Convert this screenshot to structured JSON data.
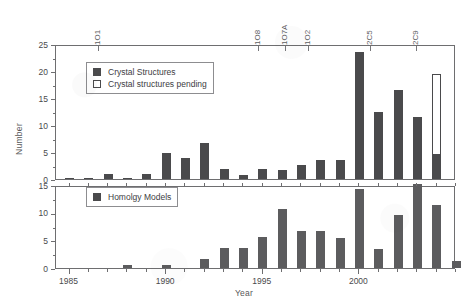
{
  "chart_data": {
    "type": "bar",
    "title": "",
    "xlabel": "Year",
    "ylabel": "Number",
    "grid": false,
    "panels": [
      {
        "name": "upper",
        "ylim": [
          0,
          25
        ],
        "yticks": [
          0,
          5,
          10,
          15,
          20,
          25
        ],
        "inverted": false,
        "legend_position": "top-left",
        "series": [
          {
            "name": "Crystal Structures",
            "color": "#4a4a4c",
            "style": "filled",
            "values": [
              0.2,
              0.2,
              0.9,
              0.2,
              0.9,
              4.8,
              3.8,
              6.7,
              1.8,
              0.8,
              1.8,
              1.7,
              2.6,
              3.5,
              3.5,
              23.6,
              12.5,
              16.5,
              11.5,
              4.4
            ]
          },
          {
            "name": "Crystal structures pending",
            "color": "#ffffff",
            "style": "open",
            "values": [
              0,
              0,
              0,
              0,
              0,
              0,
              0,
              0,
              0,
              0,
              0,
              0,
              0,
              0,
              0,
              0,
              0,
              0,
              0,
              15.1
            ]
          }
        ]
      },
      {
        "name": "lower",
        "ylim": [
          0,
          15
        ],
        "yticks": [
          0,
          5,
          10,
          15
        ],
        "inverted": true,
        "legend_position": "top-left",
        "series": [
          {
            "name": "Homolgy Models",
            "color": "#5c5c5e",
            "style": "filled",
            "values": [
              0,
              0,
              0,
              0.5,
              0,
              0.5,
              0,
              1.7,
              3.7,
              3.7,
              5.6,
              10.6,
              6.6,
              6.6,
              5.5,
              14.3,
              3.4,
              9.5,
              15.2,
              11.3,
              1.2
            ]
          }
        ]
      }
    ],
    "categories": [
      1985,
      1986,
      1987,
      1988,
      1989,
      1990,
      1991,
      1992,
      1993,
      1994,
      1995,
      1996,
      1997,
      1998,
      1999,
      2000,
      2001,
      2002,
      2003,
      2004
    ],
    "xticks": [
      1985,
      1990,
      1995,
      2000
    ],
    "xtick_labels": [
      "1985",
      "1990",
      "1995",
      "2000"
    ],
    "xlim": [
      1984.3,
      2005.0
    ],
    "top_annotations": [
      {
        "label": "1O1",
        "year": 1986.5
      },
      {
        "label": "1O8",
        "year": 1994.8
      },
      {
        "label": "1O7A",
        "year": 1996.2
      },
      {
        "label": "1O2",
        "year": 1997.4
      },
      {
        "label": "2C5",
        "year": 2000.6
      },
      {
        "label": "2C9",
        "year": 2003.0
      }
    ]
  },
  "axes": {
    "ylabel": "Number",
    "xlabel": "Year",
    "upper_yticks": [
      "25",
      "20",
      "15",
      "10",
      "5",
      "0"
    ],
    "lower_yticks": [
      "15",
      "10",
      "5",
      "0"
    ],
    "xtick_labels": [
      "1985",
      "1990",
      "1995",
      "2000"
    ]
  },
  "legend_upper": {
    "items": [
      {
        "label": "Crystal Structures",
        "style": "filled"
      },
      {
        "label": "Crystal structures pending",
        "style": "open"
      }
    ]
  },
  "legend_lower": {
    "items": [
      {
        "label": "Homolgy Models",
        "style": "filled"
      }
    ]
  }
}
